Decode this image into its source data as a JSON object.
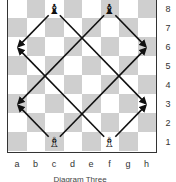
{
  "diagram": {
    "caption": "Diagram Three",
    "files": [
      "a",
      "b",
      "c",
      "d",
      "e",
      "f",
      "g",
      "h"
    ],
    "ranks": [
      "8",
      "7",
      "6",
      "5",
      "4",
      "3",
      "2",
      "1"
    ],
    "colors": {
      "light": "#ffffff",
      "dark": "#cfcfcf",
      "arrow": "#111111"
    },
    "pieces": [
      {
        "type": "bishop",
        "color": "black",
        "square": "c8",
        "glyph": "♝"
      },
      {
        "type": "bishop",
        "color": "black",
        "square": "f8",
        "glyph": "♝"
      },
      {
        "type": "bishop",
        "color": "white",
        "square": "c1",
        "glyph": "♗"
      },
      {
        "type": "bishop",
        "color": "white",
        "square": "f1",
        "glyph": "♗"
      }
    ],
    "arrows": [
      {
        "from": "c8",
        "to": "a6"
      },
      {
        "from": "c8",
        "to": "h3"
      },
      {
        "from": "f8",
        "to": "a3"
      },
      {
        "from": "f8",
        "to": "h6"
      },
      {
        "from": "c1",
        "to": "a3"
      },
      {
        "from": "c1",
        "to": "h6"
      },
      {
        "from": "f1",
        "to": "a6"
      },
      {
        "from": "f1",
        "to": "h3"
      }
    ]
  }
}
